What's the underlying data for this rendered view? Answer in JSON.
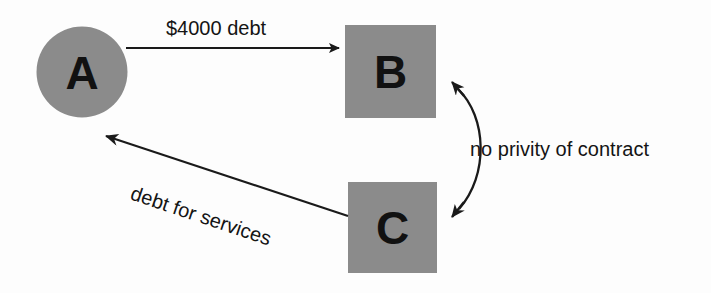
{
  "diagram": {
    "background_color": "#fdfdfd",
    "node_fill_color": "#8b8b8b",
    "line_color": "#1a1a1a",
    "text_color": "#141414",
    "nodes": [
      {
        "id": "A",
        "label": "A",
        "shape": "circle"
      },
      {
        "id": "B",
        "label": "B",
        "shape": "square"
      },
      {
        "id": "C",
        "label": "C",
        "shape": "square"
      }
    ],
    "edges": [
      {
        "id": "a-to-b",
        "from": "A",
        "to": "B",
        "label": "$4000 debt",
        "style": "straight",
        "arrows": "single"
      },
      {
        "id": "c-to-a",
        "from": "C",
        "to": "A",
        "label": "debt for services",
        "style": "straight",
        "arrows": "single"
      },
      {
        "id": "b-c-privity",
        "from": "B",
        "to": "C",
        "label": "no privity of contract",
        "style": "curved",
        "arrows": "double"
      }
    ]
  }
}
